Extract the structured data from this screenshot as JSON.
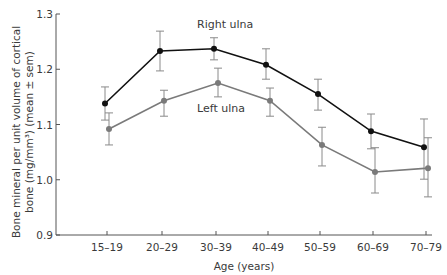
{
  "chart_data": {
    "type": "line",
    "title": "",
    "xlabel": "Age (years)",
    "ylabel_line1": "Bone mineral per unit volume of cortical",
    "ylabel_line2": "bone (mg/mm³) (mean ± sem)",
    "ylabel": "Bone mineral per unit volume of cortical bone (mg/mm³) (mean ± sem)",
    "ylim": [
      0.9,
      1.3
    ],
    "yticks": [
      0.9,
      1.0,
      1.1,
      1.2,
      1.3
    ],
    "ytick_labels": [
      "0.9",
      "1.0",
      "1.1",
      "1.2",
      "1.3"
    ],
    "categories": [
      "15–19",
      "20–29",
      "30–39",
      "40–49",
      "50–59",
      "60–69",
      "70–79"
    ],
    "grid": false,
    "legend": "inline labels",
    "series": [
      {
        "name": "Right ulna",
        "color": "#111111",
        "values": [
          1.138,
          1.233,
          1.237,
          1.208,
          1.155,
          1.088,
          1.059
        ],
        "err_upper": [
          1.168,
          1.269,
          1.257,
          1.237,
          1.182,
          1.119,
          1.11
        ],
        "err_lower": [
          1.108,
          1.197,
          1.217,
          1.182,
          1.126,
          1.056,
          1.001
        ],
        "x_offset": -2,
        "label_pos": [
          197,
          28
        ]
      },
      {
        "name": "Left ulna",
        "color": "#7a7a7a",
        "values": [
          1.092,
          1.143,
          1.175,
          1.143,
          1.063,
          1.014,
          1.021
        ],
        "err_upper": [
          1.121,
          1.162,
          1.202,
          1.166,
          1.095,
          1.058,
          1.076
        ],
        "err_lower": [
          1.063,
          1.115,
          1.15,
          1.115,
          1.025,
          0.976,
          0.969
        ],
        "x_offset": 2,
        "label_pos": [
          197,
          112
        ]
      }
    ]
  },
  "layout": {
    "plot_left": 56,
    "plot_right": 432,
    "y_top_px": 14,
    "y_bottom_px": 235,
    "x_positions": [
      107,
      162,
      216,
      268,
      320,
      373,
      426
    ]
  }
}
